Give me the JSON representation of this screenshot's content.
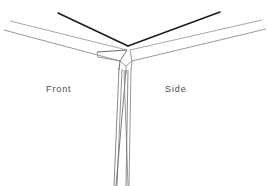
{
  "figure": {
    "width": 268,
    "height": 186,
    "background_color": "#ffffff"
  },
  "labels": {
    "front": "Front",
    "side": "Side",
    "text_color": "#4a4a4a"
  },
  "colors": {
    "dark_line": "#1a1a1a",
    "light_line": "#9a9a9a",
    "mid_line": "#6e6e6e",
    "leg_line": "#7d7d7d",
    "background": "#ffffff"
  },
  "geometry": {
    "top_edge_vertex": {
      "x": 128,
      "y": 46
    },
    "top_edge_left_end": {
      "x": 58,
      "y": 13
    },
    "top_edge_right_end": {
      "x": 220,
      "y": 12
    },
    "corner_post_top": {
      "x": 126,
      "y": 66
    },
    "corner_post_bottom": {
      "x": 120,
      "y": 186
    },
    "left_surface_far_end": {
      "x": 10,
      "y": 21
    },
    "right_surface_far_end": {
      "x": 262,
      "y": 20
    }
  }
}
